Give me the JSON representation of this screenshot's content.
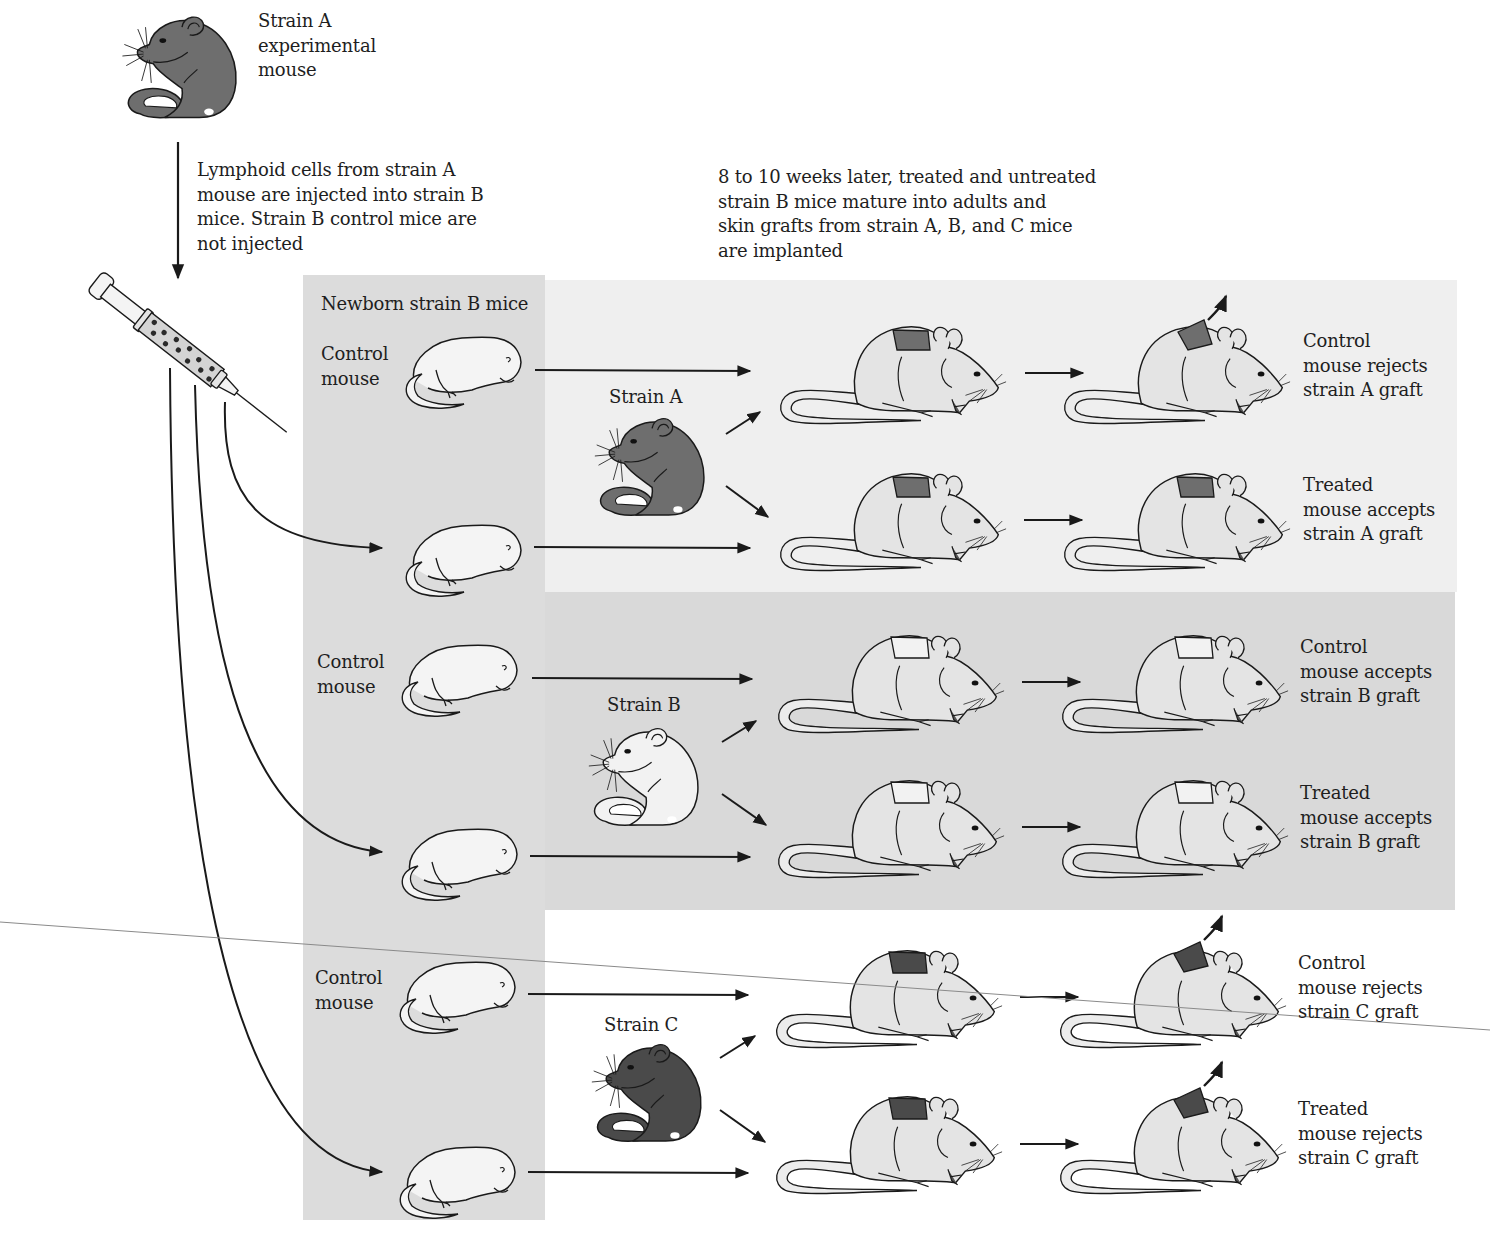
{
  "figure": {
    "source_mouse": {
      "label": "Strain A\nexperimental\nmouse",
      "color": "#6e6e6e"
    },
    "injection_note": "Lymphoid cells from strain  A\nmouse are injected into strain B\nmice.  Strain B control mice are\nnot injected",
    "timeline_note": "8 to 10 weeks later, treated and untreated\nstrain B mice mature into adults and\nskin grafts from strain A, B, and C mice\nare implanted",
    "newborn_column": {
      "title": "Newborn strain B mice",
      "control_label": "Control\nmouse",
      "background": "#dcdcdc"
    },
    "donors": [
      {
        "label": "Strain A",
        "color": "#6e6e6e",
        "panel_bg": "#efefef"
      },
      {
        "label": "Strain B",
        "color": "#f2f2f2",
        "panel_bg": "#d9d9d9"
      },
      {
        "label": "Strain C",
        "color": "#4a4a4a",
        "panel_bg": "#ffffff"
      }
    ],
    "outcomes": [
      {
        "group": "A",
        "subject": "control",
        "result": "Control\nmouse rejects\nstrain A graft",
        "graft_color": "#6e6e6e",
        "rejected": true
      },
      {
        "group": "A",
        "subject": "treated",
        "result": "Treated\nmouse accepts\nstrain A graft",
        "graft_color": "#6e6e6e",
        "rejected": false
      },
      {
        "group": "B",
        "subject": "control",
        "result": "Control\nmouse accepts\nstrain B graft",
        "graft_color": "#f2f2f2",
        "rejected": false
      },
      {
        "group": "B",
        "subject": "treated",
        "result": "Treated\nmouse accepts\nstrain B graft",
        "graft_color": "#f2f2f2",
        "rejected": false
      },
      {
        "group": "C",
        "subject": "control",
        "result": "Control\nmouse rejects\nstrain C graft",
        "graft_color": "#4a4a4a",
        "rejected": true
      },
      {
        "group": "C",
        "subject": "treated",
        "result": "Treated\nmouse rejects\nstrain C graft",
        "graft_color": "#4a4a4a",
        "rejected": true
      }
    ],
    "colors": {
      "adult_body": "#e4e4e4",
      "outline": "#1a1a1a",
      "arrow": "#1a1a1a"
    }
  }
}
